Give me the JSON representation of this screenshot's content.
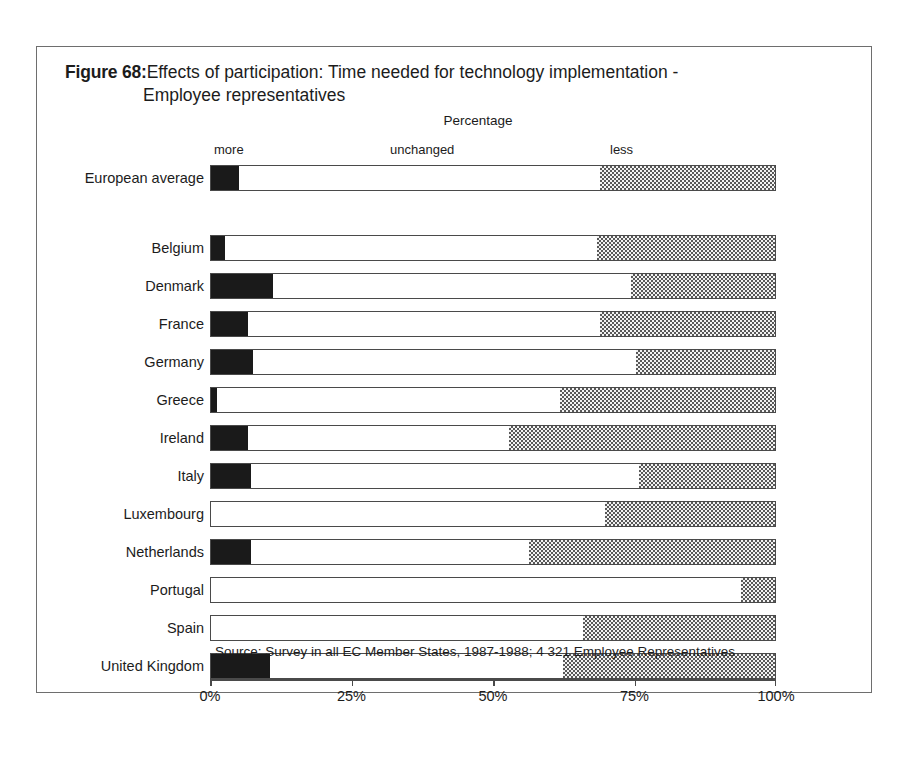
{
  "figure": {
    "label": "Figure 68:",
    "title_line_1": "Effects of participation: Time needed for technology implementation -",
    "title_line_2": "Employee representatives",
    "axis_caption": "Percentage",
    "source": "Source: Survey in all EC Member States, 1987-1988; 4 321 Employee Representatives"
  },
  "colors": {
    "more": "#1a1a1a",
    "unchanged": "#ffffff",
    "less": "#c8c8c8",
    "frame": "#6e6e6e",
    "axis": "#4a4a4a",
    "text": "#1c1c1c"
  },
  "chart_data": {
    "type": "bar",
    "orientation": "horizontal",
    "stacked": true,
    "stack_total": 100,
    "title": "Effects of participation: Time needed for technology implementation - Employee representatives",
    "xlabel": "Percentage",
    "ylabel": "",
    "xlim": [
      0,
      100
    ],
    "xticks": [
      0,
      25,
      50,
      75,
      100
    ],
    "xtick_labels": [
      "0%",
      "25%",
      "50%",
      "75%",
      "100%"
    ],
    "grid": false,
    "legend_position": "top-inline",
    "legend": [
      "more",
      "unchanged",
      "less"
    ],
    "categories": [
      "European average",
      "Belgium",
      "Denmark",
      "France",
      "Germany",
      "Greece",
      "Ireland",
      "Italy",
      "Luxembourg",
      "Netherlands",
      "Portugal",
      "Spain",
      "United Kingdom"
    ],
    "series": [
      {
        "name": "more",
        "values": [
          5,
          2.5,
          11,
          6.5,
          7.5,
          1,
          6.5,
          7,
          0,
          7,
          0,
          0,
          10.5
        ]
      },
      {
        "name": "unchanged",
        "values": [
          64,
          66,
          63.5,
          62.5,
          68,
          61,
          46.5,
          69,
          70,
          49.5,
          94,
          66,
          52
        ]
      },
      {
        "name": "less",
        "values": [
          31,
          31.5,
          25.5,
          31,
          24.5,
          38,
          47,
          24,
          30,
          43.5,
          6,
          34,
          37.5
        ]
      }
    ]
  }
}
